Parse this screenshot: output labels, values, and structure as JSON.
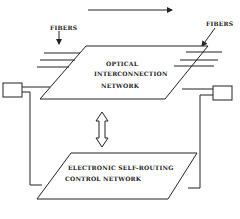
{
  "diagram": {
    "labels": {
      "fibers_left": "FIBERS",
      "fibers_right": "FIBERS",
      "optical_line1": "OPTICAL",
      "optical_line2": "INTERCONNECTION",
      "optical_line3": "NETWORK",
      "electronic_line1": "ELECTRONIC   SELF-ROUTING",
      "electronic_line2": "CONTROL   NETWORK"
    },
    "colors": {
      "stroke": "#222222",
      "background": "#ffffff"
    }
  }
}
